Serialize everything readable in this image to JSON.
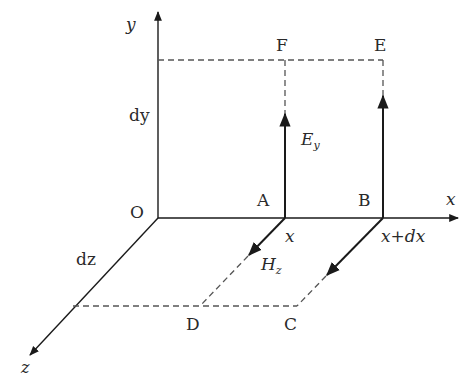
{
  "diagram": {
    "axes": {
      "x_label": "x",
      "y_label": "y",
      "z_label": "z",
      "origin_label": "O"
    },
    "points": {
      "A": "A",
      "B": "B",
      "C": "C",
      "D": "D",
      "E": "E",
      "F": "F"
    },
    "dimensions": {
      "dy": "dy",
      "dz": "dz"
    },
    "positions": {
      "x_at_A": "x",
      "x_at_B": "x+dx"
    },
    "fields": {
      "electric": {
        "symbol": "E",
        "subscript": "y"
      },
      "magnetic": {
        "symbol": "H",
        "subscript": "z"
      }
    },
    "colors": {
      "line": "#1a1a1a",
      "dashed": "#555555",
      "text": "#2a2a2a"
    }
  }
}
